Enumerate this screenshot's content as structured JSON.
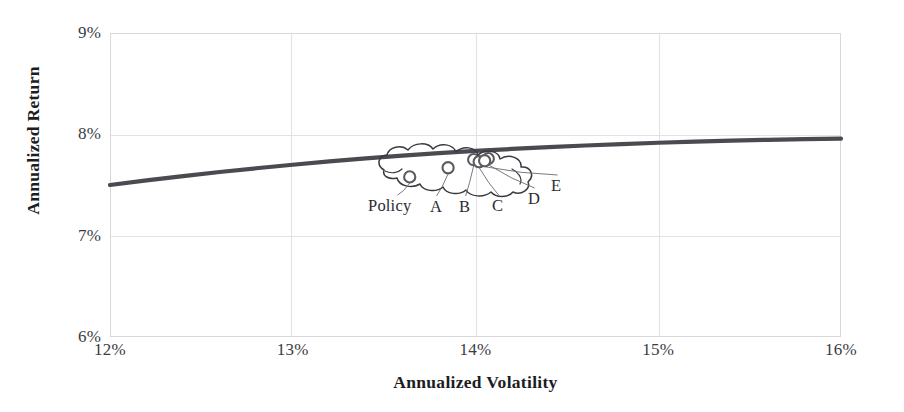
{
  "chart_data": {
    "type": "line",
    "title": "",
    "subtitle": "",
    "xlabel": "Annualized Volatility",
    "ylabel": "Annualized Return",
    "xlim": [
      12,
      16
    ],
    "ylim": [
      6,
      9
    ],
    "xtick_labels": [
      "12%",
      "13%",
      "14%",
      "15%",
      "16%"
    ],
    "xtick_values": [
      12,
      13,
      14,
      15,
      16
    ],
    "ytick_labels": [
      "6%",
      "7%",
      "8%",
      "9%"
    ],
    "ytick_values": [
      6,
      7,
      8,
      9
    ],
    "grid": true,
    "legend_position": "none",
    "series": [
      {
        "name": "Efficient Frontier",
        "type": "line",
        "color": "#4a4a50",
        "x": [
          12.0,
          12.2,
          12.4,
          12.6,
          12.8,
          13.0,
          13.2,
          13.4,
          13.6,
          13.8,
          14.0,
          14.2,
          14.4,
          14.6,
          14.8,
          15.0,
          15.2,
          15.4,
          15.6,
          15.8,
          16.0
        ],
        "y": [
          7.5,
          7.545,
          7.588,
          7.628,
          7.665,
          7.7,
          7.733,
          7.763,
          7.79,
          7.814,
          7.836,
          7.856,
          7.874,
          7.89,
          7.904,
          7.917,
          7.928,
          7.938,
          7.946,
          7.952,
          7.957
        ]
      },
      {
        "name": "Portfolios",
        "type": "scatter",
        "color": "#5a5a60",
        "points": [
          {
            "label": "Policy",
            "x": 13.64,
            "y": 7.58
          },
          {
            "label": "A",
            "x": 13.85,
            "y": 7.67
          },
          {
            "label": "B",
            "x": 13.99,
            "y": 7.75
          },
          {
            "label": "C",
            "x": 14.02,
            "y": 7.73
          },
          {
            "label": "D",
            "x": 14.07,
            "y": 7.76
          },
          {
            "label": "E",
            "x": 14.05,
            "y": 7.74
          }
        ]
      }
    ],
    "annotations": [
      {
        "name": "cloud-outline",
        "shape": "cloud",
        "note": "hand-drawn cloud encircling the portfolio points"
      },
      {
        "name": "leader-lines",
        "note": "thin lines connecting each point to its label"
      }
    ]
  },
  "point_labels": [
    {
      "text": "Policy",
      "left": 368,
      "top": 196
    },
    {
      "text": "A",
      "left": 430,
      "top": 197
    },
    {
      "text": "B",
      "left": 459,
      "top": 197
    },
    {
      "text": "C",
      "left": 492,
      "top": 196
    },
    {
      "text": "D",
      "left": 528,
      "top": 189
    },
    {
      "text": "E",
      "left": 551,
      "top": 176
    }
  ],
  "colors": {
    "curve": "#4a4a50",
    "marker_stroke": "#5a5a60",
    "grid": "#e2e2e6",
    "frame": "#d8d8dc",
    "text": "#1c1c22",
    "tick_text": "#3b3b42",
    "cloud": "#3a3a40"
  }
}
